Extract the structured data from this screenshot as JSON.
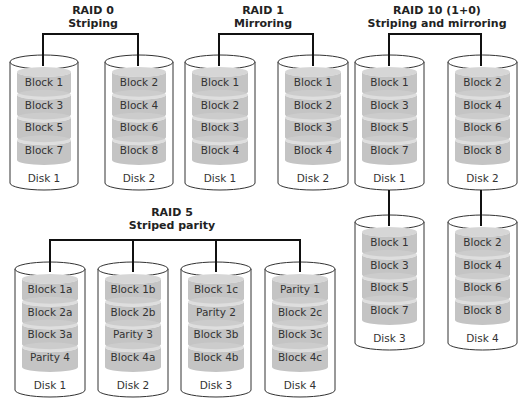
{
  "colors": {
    "platter": "#c4c4c4",
    "platter_top": "#d6d6d6",
    "outline": "#333333",
    "connector": "#111111"
  },
  "groups": [
    {
      "id": "raid0",
      "title": "RAID 0",
      "subtitle": "Striping",
      "disks": [
        {
          "label": "Disk 1",
          "blocks": [
            "Block 1",
            "Block 3",
            "Block 5",
            "Block 7"
          ]
        },
        {
          "label": "Disk 2",
          "blocks": [
            "Block 2",
            "Block 4",
            "Block 6",
            "Block 8"
          ]
        }
      ]
    },
    {
      "id": "raid1",
      "title": "RAID 1",
      "subtitle": "Mirroring",
      "disks": [
        {
          "label": "Disk 1",
          "blocks": [
            "Block 1",
            "Block 2",
            "Block 3",
            "Block 4"
          ]
        },
        {
          "label": "Disk 2",
          "blocks": [
            "Block 1",
            "Block 2",
            "Block 3",
            "Block 4"
          ]
        }
      ]
    },
    {
      "id": "raid10",
      "title": "RAID 10 (1+0)",
      "subtitle": "Striping and mirroring",
      "disks": [
        {
          "label": "Disk 1",
          "blocks": [
            "Block 1",
            "Block 3",
            "Block 5",
            "Block 7"
          ]
        },
        {
          "label": "Disk 2",
          "blocks": [
            "Block 2",
            "Block 4",
            "Block 6",
            "Block 8"
          ]
        },
        {
          "label": "Disk 3",
          "blocks": [
            "Block 1",
            "Block 3",
            "Block 5",
            "Block 7"
          ]
        },
        {
          "label": "Disk 4",
          "blocks": [
            "Block 2",
            "Block 4",
            "Block 6",
            "Block 8"
          ]
        }
      ]
    },
    {
      "id": "raid5",
      "title": "RAID 5",
      "subtitle": "Striped parity",
      "disks": [
        {
          "label": "Disk 1",
          "blocks": [
            "Block 1a",
            "Block 2a",
            "Block 3a",
            "Parity 4"
          ]
        },
        {
          "label": "Disk 2",
          "blocks": [
            "Block 1b",
            "Block 2b",
            "Parity 3",
            "Block 4a"
          ]
        },
        {
          "label": "Disk 3",
          "blocks": [
            "Block 1c",
            "Parity 2",
            "Block 3b",
            "Block 4b"
          ]
        },
        {
          "label": "Disk 4",
          "blocks": [
            "Parity 1",
            "Block 2c",
            "Block 3c",
            "Block 4c"
          ]
        }
      ]
    }
  ]
}
